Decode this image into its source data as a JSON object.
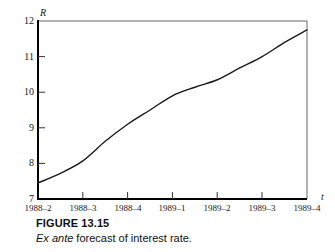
{
  "figure": {
    "caption_title": "FIGURE 13.15",
    "caption_emphasis": "Ex ante",
    "caption_rest": " forecast of interest rate."
  },
  "axes": {
    "y_variable": "R",
    "x_variable": "t"
  },
  "colors": {
    "line": "#1a1a1a",
    "axis": "#000000",
    "frame": "#555555",
    "text": "#111111",
    "background": "#ffffff"
  },
  "chart_data": {
    "type": "line",
    "title": "Ex ante forecast of interest rate.",
    "xlabel": "t",
    "ylabel": "R",
    "categories": [
      "1988-2",
      "1988-3",
      "1988-4",
      "1989-1",
      "1989-2",
      "1989-3",
      "1989-4"
    ],
    "x_tick_labels": [
      "1988–2",
      "1988–3",
      "1988–4",
      "1989–1",
      "1989–2",
      "1989–3",
      "1989–4"
    ],
    "y_tick_labels": [
      "7",
      "8",
      "9",
      "10",
      "11",
      "12"
    ],
    "y_ticks": [
      7,
      8,
      9,
      10,
      11,
      12
    ],
    "ylim": [
      7,
      12
    ],
    "grid": false,
    "legend": null,
    "series": [
      {
        "name": "Ex ante forecast of interest rate",
        "values": [
          7.45,
          8.07,
          9.1,
          9.9,
          10.35,
          11.0,
          11.75
        ],
        "interpolated_points": [
          {
            "x": "1988-2",
            "y": 7.45
          },
          {
            "x": "1988-2.5",
            "y": 7.72
          },
          {
            "x": "1988-3",
            "y": 8.07
          },
          {
            "x": "1988-3.5",
            "y": 8.62
          },
          {
            "x": "1988-4",
            "y": 9.1
          },
          {
            "x": "1988-4.5",
            "y": 9.5
          },
          {
            "x": "1989-1",
            "y": 9.9
          },
          {
            "x": "1989-1.5",
            "y": 10.14
          },
          {
            "x": "1989-2",
            "y": 10.35
          },
          {
            "x": "1989-2.5",
            "y": 10.68
          },
          {
            "x": "1989-3",
            "y": 11.0
          },
          {
            "x": "1989-3.5",
            "y": 11.4
          },
          {
            "x": "1989-4",
            "y": 11.75
          }
        ]
      }
    ]
  }
}
